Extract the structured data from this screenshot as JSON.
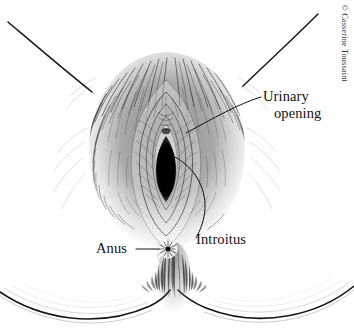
{
  "figure": {
    "medium": "pen-and-ink line drawing",
    "background_color": "#ffffff",
    "ink_color": "#111111",
    "width": 354,
    "height": 334
  },
  "credit": {
    "text": "© Casserine Toussaint",
    "symbol": "©",
    "artist": "Casserine Toussaint",
    "orientation": "vertical-rotated-90"
  },
  "labels": [
    {
      "id": "urinary-opening",
      "line1": "Urinary",
      "line2": "opening",
      "full": "Urinary opening",
      "leader": "curved line from label left edge down to urethral meatus"
    },
    {
      "id": "introitus",
      "line1": "Introitus",
      "full": "Introitus",
      "leader": "curved line arcing up-left from label to vaginal opening"
    },
    {
      "id": "anus",
      "line1": "Anus",
      "full": "Anus",
      "leader": "horizontal line from label right edge to anal opening"
    }
  ],
  "anatomy_parts": [
    "left thigh contour",
    "right thigh contour",
    "mons pubis with pubic hair",
    "labia majora",
    "labia minora",
    "urethral meatus",
    "vaginal introitus",
    "perineum",
    "anus",
    "left buttock",
    "right buttock",
    "gluteal cleft"
  ]
}
